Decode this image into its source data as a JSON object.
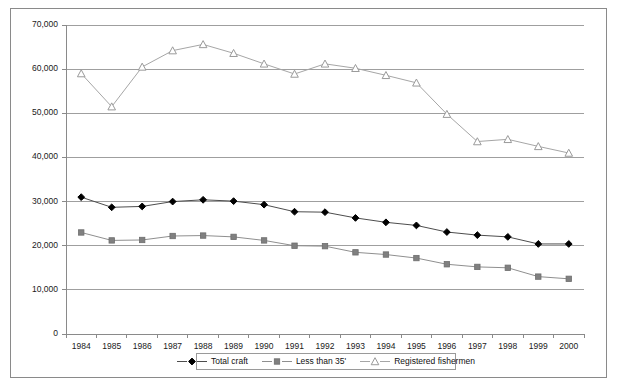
{
  "chart_data": {
    "type": "line",
    "title": "",
    "subtitle": "",
    "xlabel": "",
    "ylabel": "",
    "x": [
      1984,
      1985,
      1986,
      1987,
      1988,
      1989,
      1990,
      1991,
      1992,
      1993,
      1994,
      1995,
      1996,
      1997,
      1998,
      1999,
      2000
    ],
    "categories": [
      "1984",
      "1985",
      "1986",
      "1987",
      "1988",
      "1989",
      "1990",
      "1991",
      "1992",
      "1993",
      "1994",
      "1995",
      "1996",
      "1997",
      "1998",
      "1999",
      "2000"
    ],
    "series": [
      {
        "name": "Total craft",
        "marker": "diamond",
        "color": "#000000",
        "values": [
          31000,
          28700,
          28900,
          30000,
          30400,
          30100,
          29300,
          27700,
          27600,
          26300,
          25300,
          24600,
          23100,
          22400,
          22000,
          20400,
          20400
        ]
      },
      {
        "name": "Less than 35'",
        "marker": "square",
        "color": "#808080",
        "values": [
          23000,
          21200,
          21300,
          22200,
          22300,
          22000,
          21200,
          20000,
          19900,
          18500,
          18000,
          17200,
          15800,
          15200,
          15000,
          13000,
          12500
        ]
      },
      {
        "name": "Registered fishermen",
        "marker": "triangle",
        "color": "#9a9a9a",
        "values": [
          59000,
          51500,
          60500,
          64200,
          65600,
          63600,
          61200,
          58900,
          61200,
          60200,
          58600,
          56900,
          49800,
          43600,
          44100,
          42500,
          41000
        ]
      }
    ],
    "ylim": [
      0,
      70000
    ],
    "ytick_values": [
      0,
      10000,
      20000,
      30000,
      40000,
      50000,
      60000,
      70000
    ],
    "ytick_labels": [
      "0",
      "10,000",
      "20,000",
      "30,000",
      "40,000",
      "50,000",
      "60,000",
      "70,000"
    ],
    "grid": true,
    "grid_axis": "y",
    "legend_position": "bottom",
    "legend_entries": [
      {
        "label": "Total craft",
        "marker": "diamond",
        "color": "#000000"
      },
      {
        "label": "Less than 35'",
        "marker": "square",
        "color": "#808080"
      },
      {
        "label": "Registered fishermen",
        "marker": "triangle",
        "color": "#9a9a9a"
      }
    ]
  }
}
